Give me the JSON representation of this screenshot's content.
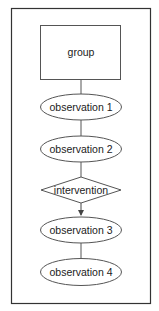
{
  "diagram": {
    "type": "flowchart",
    "colors": {
      "stroke": "#444444",
      "frame": "#333333",
      "text": "#222222",
      "background": "#ffffff"
    },
    "nodes": [
      {
        "id": "group",
        "shape": "rectangle",
        "label": "group"
      },
      {
        "id": "obs1",
        "shape": "ellipse",
        "label": "observation 1"
      },
      {
        "id": "obs2",
        "shape": "ellipse",
        "label": "observation 2"
      },
      {
        "id": "intervention",
        "shape": "diamond",
        "label": "intervention"
      },
      {
        "id": "obs3",
        "shape": "ellipse",
        "label": "observation 3"
      },
      {
        "id": "obs4",
        "shape": "ellipse",
        "label": "observation 4"
      }
    ],
    "edges": [
      {
        "from": "group",
        "to": "obs1",
        "arrow": false
      },
      {
        "from": "obs1",
        "to": "obs2",
        "arrow": false
      },
      {
        "from": "obs2",
        "to": "intervention",
        "arrow": false
      },
      {
        "from": "intervention",
        "to": "obs3",
        "arrow": true
      },
      {
        "from": "obs3",
        "to": "obs4",
        "arrow": false
      }
    ]
  }
}
